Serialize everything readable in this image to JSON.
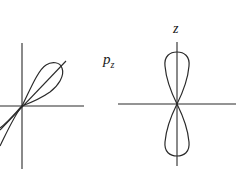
{
  "diagram": {
    "panels": [
      {
        "name": "tilted-orbital",
        "label": "",
        "axes": [
          "vertical",
          "horizontal",
          "diagonal"
        ]
      },
      {
        "name": "pz-orbital",
        "label": "p",
        "label_subscript": "z",
        "axis_label": "z",
        "axes": [
          "vertical",
          "horizontal"
        ]
      }
    ],
    "colors": {
      "line": "#2a2a2a",
      "background": "#ffffff"
    }
  }
}
